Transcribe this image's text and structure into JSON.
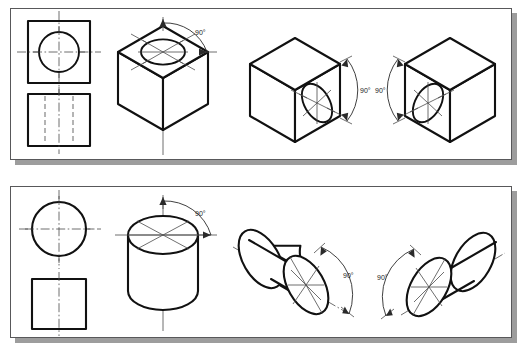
{
  "figure": {
    "background_color": "#ffffff",
    "line_color": "#111111",
    "shadow_color": "#9d9d9d",
    "border_color": "#58585a"
  },
  "panels": [
    {
      "id": "panel-cube",
      "name": "cube-panel",
      "subject": "cube",
      "views": [
        {
          "name": "top-view",
          "type": "orthographic",
          "shape": "square-with-circle",
          "description": "Top view: square outline with circle and crossing centerlines"
        },
        {
          "name": "front-view",
          "type": "orthographic",
          "shape": "square-with-hidden-lines",
          "description": "Front view: square outline with two vertical hidden lines and a centerline"
        },
        {
          "name": "isometric-top-face",
          "type": "isometric",
          "shape": "cube-with-ellipse-on-top",
          "angle_label": "90°",
          "angle_value": 90,
          "angle_unit": "degrees",
          "face": "top"
        },
        {
          "name": "isometric-right-face",
          "type": "isometric",
          "shape": "cube-with-ellipse-on-right",
          "angle_label": "90°",
          "angle_value": 90,
          "angle_unit": "degrees",
          "face": "right"
        },
        {
          "name": "isometric-left-face",
          "type": "isometric",
          "shape": "cube-with-ellipse-on-left",
          "angle_label": "90°",
          "angle_value": 90,
          "angle_unit": "degrees",
          "face": "left"
        }
      ]
    },
    {
      "id": "panel-cylinder",
      "name": "cylinder-panel",
      "subject": "cylinder",
      "views": [
        {
          "name": "top-view",
          "type": "orthographic",
          "shape": "circle-with-centerlines",
          "description": "Top view: circle with crossing centerlines"
        },
        {
          "name": "front-view",
          "type": "orthographic",
          "shape": "square-with-centerline",
          "description": "Front view: square outline with vertical centerline"
        },
        {
          "name": "isometric-vertical",
          "type": "isometric",
          "shape": "upright-cylinder",
          "angle_label": "90°",
          "angle_value": 90,
          "angle_unit": "degrees",
          "axis": "vertical"
        },
        {
          "name": "isometric-right-axis",
          "type": "isometric",
          "shape": "tilted-cylinder-right",
          "angle_label": "90°",
          "angle_value": 90,
          "angle_unit": "degrees",
          "axis": "right-receding"
        },
        {
          "name": "isometric-left-axis",
          "type": "isometric",
          "shape": "tilted-cylinder-left",
          "angle_label": "90°",
          "angle_value": 90,
          "angle_unit": "degrees",
          "axis": "left-receding"
        }
      ]
    }
  ],
  "labels": {
    "cube_top_angle": "90°",
    "cube_right_angle": "90°",
    "cube_left_angle": "90°",
    "cyl_top_angle": "90°",
    "cyl_right_angle": "90°",
    "cyl_left_angle": "90°"
  }
}
